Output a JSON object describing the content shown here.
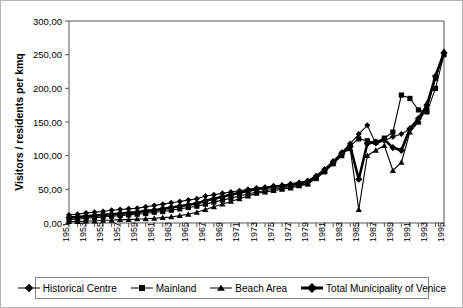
{
  "chart_data": {
    "type": "line",
    "title": "",
    "xlabel": "",
    "ylabel": "Visitors / residents per kmq",
    "ylim": [
      0,
      300
    ],
    "ytick_labels": [
      "0,00",
      "50,00",
      "100,00",
      "150,00",
      "200,00",
      "250,00",
      "300,00"
    ],
    "ytick_values": [
      0,
      50,
      100,
      150,
      200,
      250,
      300
    ],
    "grid": false,
    "legend_position": "bottom",
    "x": [
      1951,
      1952,
      1953,
      1954,
      1955,
      1956,
      1957,
      1958,
      1959,
      1960,
      1961,
      1962,
      1963,
      1964,
      1965,
      1966,
      1967,
      1968,
      1969,
      1970,
      1971,
      1972,
      1973,
      1974,
      1975,
      1976,
      1977,
      1978,
      1979,
      1980,
      1981,
      1982,
      1983,
      1984,
      1985,
      1986,
      1987,
      1988,
      1989,
      1990,
      1991,
      1992,
      1993,
      1994,
      1995
    ],
    "xtick_labels": [
      "1951",
      "1953",
      "1955",
      "1957",
      "1959",
      "1961",
      "1963",
      "1965",
      "1967",
      "1969",
      "1971",
      "1973",
      "1975",
      "1977",
      "1979",
      "1981",
      "1983",
      "1985",
      "1987",
      "1989",
      "1991",
      "1993",
      "1995"
    ],
    "xlim": [
      1951,
      1995
    ],
    "series": [
      {
        "name": "Historical Centre",
        "marker": "diamond",
        "values": [
          12,
          13,
          15,
          16,
          17,
          19,
          20,
          21,
          22,
          24,
          26,
          28,
          30,
          32,
          34,
          36,
          40,
          42,
          44,
          46,
          48,
          50,
          52,
          53,
          55,
          56,
          58,
          60,
          63,
          70,
          80,
          92,
          105,
          118,
          132,
          145,
          118,
          122,
          128,
          132,
          140,
          150,
          170,
          215,
          252
        ]
      },
      {
        "name": "Mainland",
        "marker": "square",
        "values": [
          5,
          6,
          7,
          8,
          9,
          10,
          11,
          12,
          13,
          14,
          16,
          17,
          19,
          21,
          23,
          25,
          28,
          31,
          34,
          37,
          40,
          43,
          46,
          48,
          50,
          52,
          54,
          56,
          58,
          66,
          76,
          88,
          100,
          115,
          125,
          122,
          120,
          126,
          135,
          190,
          185,
          168,
          165,
          200,
          250
        ]
      },
      {
        "name": "Beach Area",
        "marker": "triangle",
        "values": [
          2,
          2,
          3,
          3,
          4,
          4,
          5,
          5,
          6,
          6,
          7,
          8,
          9,
          11,
          13,
          16,
          20,
          24,
          28,
          32,
          36,
          40,
          44,
          46,
          48,
          50,
          52,
          55,
          58,
          68,
          78,
          90,
          104,
          110,
          20,
          100,
          108,
          115,
          78,
          90,
          135,
          150,
          178,
          215,
          255
        ]
      },
      {
        "name": "Total Municipality of Venice",
        "marker": "diamond-thick",
        "values": [
          8,
          9,
          10,
          11,
          12,
          13,
          14,
          15,
          16,
          18,
          19,
          21,
          23,
          25,
          27,
          29,
          33,
          36,
          39,
          42,
          45,
          48,
          50,
          52,
          54,
          55,
          57,
          59,
          61,
          69,
          79,
          90,
          103,
          114,
          65,
          118,
          120,
          124,
          112,
          108,
          140,
          155,
          175,
          218,
          253
        ]
      }
    ]
  },
  "legend": {
    "entries": [
      {
        "label": "Historical Centre",
        "marker": "diamond"
      },
      {
        "label": "Mainland",
        "marker": "square"
      },
      {
        "label": "Beach Area",
        "marker": "triangle"
      },
      {
        "label": "Total Municipality of Venice",
        "marker": "diamond-thick"
      }
    ]
  },
  "colors": {
    "line": "#000000",
    "axis": "#555555",
    "border": "#b5b5b5",
    "background": "#ffffff"
  }
}
